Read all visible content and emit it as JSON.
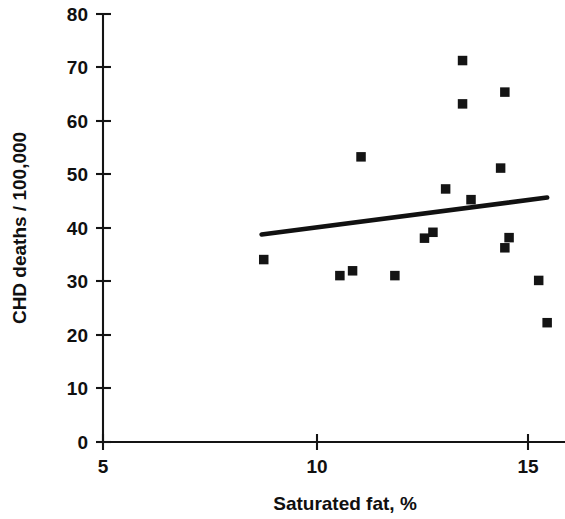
{
  "chart_data": {
    "type": "scatter",
    "title": "",
    "xlabel": "Saturated fat, %",
    "ylabel": "CHD deaths / 100,000",
    "xlim": [
      5,
      15.9
    ],
    "ylim": [
      0,
      80
    ],
    "xticks": [
      5,
      10,
      15
    ],
    "xtick_labels": [
      "5",
      "10",
      "15"
    ],
    "yticks": [
      0,
      10,
      20,
      30,
      40,
      50,
      60,
      70,
      80
    ],
    "ytick_labels": [
      "0",
      "10",
      "20",
      "30",
      "40",
      "50",
      "60",
      "70",
      "80"
    ],
    "grid": false,
    "legend": false,
    "marker": "square",
    "marker_color": "#141414",
    "points": [
      {
        "x": 8.8,
        "y": 34.1
      },
      {
        "x": 10.6,
        "y": 31.1
      },
      {
        "x": 10.9,
        "y": 32.0
      },
      {
        "x": 11.1,
        "y": 53.3
      },
      {
        "x": 11.9,
        "y": 31.1
      },
      {
        "x": 12.6,
        "y": 38.1
      },
      {
        "x": 12.8,
        "y": 39.2
      },
      {
        "x": 13.1,
        "y": 47.3
      },
      {
        "x": 13.5,
        "y": 63.2
      },
      {
        "x": 13.5,
        "y": 71.3
      },
      {
        "x": 13.7,
        "y": 45.3
      },
      {
        "x": 14.4,
        "y": 51.2
      },
      {
        "x": 14.5,
        "y": 36.3
      },
      {
        "x": 14.5,
        "y": 65.4
      },
      {
        "x": 14.6,
        "y": 38.2
      },
      {
        "x": 15.3,
        "y": 30.2
      },
      {
        "x": 15.5,
        "y": 22.3
      }
    ],
    "trend_line": {
      "x_start": 8.75,
      "y_start": 38.8,
      "x_end": 15.5,
      "y_end": 45.7,
      "color": "#111111"
    }
  },
  "axes": {
    "x_title": "Saturated fat, %",
    "y_title": "CHD deaths / 100,000"
  }
}
